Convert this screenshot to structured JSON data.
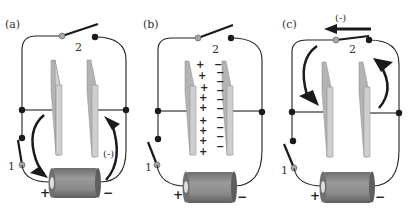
{
  "figure": {
    "colors": {
      "wire": "#222222",
      "plate_face": "#cfcfcf",
      "plate_edge": "#a9a9a9",
      "node": "#1a1a1a",
      "pivot": "#a8a8a8",
      "battery_body": "#8a8a8a",
      "battery_end": "#d6d6d6",
      "arrow": "#1a1a1a"
    },
    "panels": [
      {
        "id": "a",
        "label": "(a)",
        "offset_x": 0,
        "switch1_label": "1",
        "switch2_label": "2",
        "switch1_state": "closed",
        "switch2_state": "open",
        "battery_plus": "+",
        "battery_minus": "−",
        "current_tag": "(-)",
        "description": "Switch 1 closed: battery charges the plates; electrons flow from plate to + terminal and from − terminal to the other plate."
      },
      {
        "id": "b",
        "label": "(b)",
        "offset_x": 138,
        "switch1_label": "1",
        "switch2_label": "2",
        "switch1_state": "open",
        "switch2_state": "open",
        "battery_plus": "+",
        "battery_minus": "−",
        "left_plate_charges": [
          "+",
          "+",
          "+",
          "+",
          "+",
          "+",
          "+",
          "+",
          "+",
          "+"
        ],
        "right_plate_charges": [
          "−",
          "−",
          "−",
          "−",
          "−",
          "−",
          "−",
          "−",
          "−",
          "−",
          "−"
        ],
        "description": "Both switches open: plates hold + and − charge."
      },
      {
        "id": "c",
        "label": "(c)",
        "offset_x": 277,
        "switch1_label": "1",
        "switch2_label": "2",
        "switch1_state": "open",
        "switch2_state": "closed",
        "battery_plus": "+",
        "battery_minus": "−",
        "current_tag": "(-)",
        "description": "Switch 2 closed: capacitor discharges through the top wire."
      }
    ]
  }
}
